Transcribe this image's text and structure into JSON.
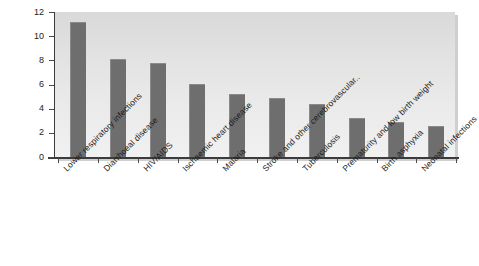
{
  "chart_data": {
    "type": "bar",
    "title": "",
    "subtitle": "",
    "xlabel": "",
    "ylabel": "",
    "ylim": [
      0,
      12
    ],
    "y_ticks": [
      0,
      2,
      4,
      6,
      8,
      10,
      12
    ],
    "grid": false,
    "legend": false,
    "orientation": "vertical",
    "categories": [
      "Lower respiratory infections",
      "Diarrhoeal disease",
      "HIV/AIDS",
      "Ischaemic heart disease",
      "Malaria",
      "Stroke and other cerebrovascular..",
      "Tuberculosis",
      "Prematurity and low birth weight",
      "Birth asphyxia",
      "Neonatal infections"
    ],
    "values": [
      11.2,
      8.1,
      7.75,
      6.05,
      5.2,
      4.9,
      4.35,
      3.2,
      2.9,
      2.55
    ],
    "series": [
      {
        "name": "",
        "values": [
          11.2,
          8.1,
          7.75,
          6.05,
          5.2,
          4.9,
          4.35,
          3.2,
          2.9,
          2.55
        ]
      }
    ],
    "colors": {
      "bar": "#6e6e6e",
      "bar_highlight": "#8a8a8a",
      "plot_background_top": "#d9d9d9",
      "plot_background_bottom": "#f1f1f1",
      "axis": "#3b3b3b",
      "text": "#1d1d1d",
      "page_background": "#ffffff"
    }
  }
}
